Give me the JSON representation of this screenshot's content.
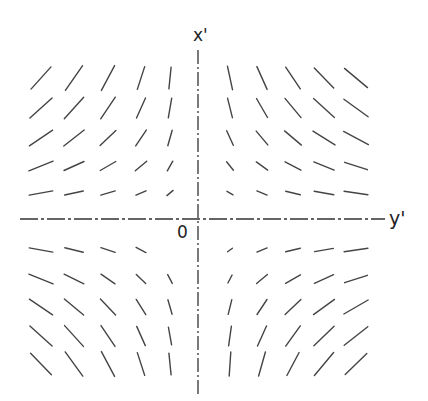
{
  "diagram": {
    "type": "direction-field",
    "axes": {
      "vertical_label": "x'",
      "horizontal_label": "y'",
      "origin_label": "0",
      "style": "dash-dot",
      "color": "#333333"
    },
    "columns_x": [
      41,
      74,
      108,
      141,
      170,
      230,
      262,
      293,
      324,
      356
    ],
    "rows_y": [
      78,
      108,
      138,
      166,
      193,
      250,
      279,
      307,
      336,
      364
    ],
    "segment_color": "#444444",
    "segments": [
      {
        "cx": 41,
        "cy": 78,
        "angle": -48,
        "len": 30
      },
      {
        "cx": 74,
        "cy": 78,
        "angle": -55,
        "len": 30
      },
      {
        "cx": 108,
        "cy": 78,
        "angle": -62,
        "len": 28
      },
      {
        "cx": 141,
        "cy": 78,
        "angle": -72,
        "len": 24
      },
      {
        "cx": 170,
        "cy": 78,
        "angle": -84,
        "len": 22
      },
      {
        "cx": 230,
        "cy": 78,
        "angle": 78,
        "len": 24
      },
      {
        "cx": 262,
        "cy": 78,
        "angle": 66,
        "len": 25
      },
      {
        "cx": 293,
        "cy": 78,
        "angle": 56,
        "len": 26
      },
      {
        "cx": 324,
        "cy": 78,
        "angle": 46,
        "len": 28
      },
      {
        "cx": 356,
        "cy": 78,
        "angle": 40,
        "len": 30
      },
      {
        "cx": 41,
        "cy": 108,
        "angle": -42,
        "len": 30
      },
      {
        "cx": 74,
        "cy": 108,
        "angle": -48,
        "len": 29
      },
      {
        "cx": 108,
        "cy": 108,
        "angle": -56,
        "len": 26
      },
      {
        "cx": 141,
        "cy": 108,
        "angle": -66,
        "len": 22
      },
      {
        "cx": 170,
        "cy": 108,
        "angle": -80,
        "len": 20
      },
      {
        "cx": 230,
        "cy": 108,
        "angle": 76,
        "len": 20
      },
      {
        "cx": 262,
        "cy": 108,
        "angle": 60,
        "len": 22
      },
      {
        "cx": 293,
        "cy": 108,
        "angle": 50,
        "len": 25
      },
      {
        "cx": 324,
        "cy": 108,
        "angle": 42,
        "len": 28
      },
      {
        "cx": 356,
        "cy": 108,
        "angle": 36,
        "len": 30
      },
      {
        "cx": 41,
        "cy": 138,
        "angle": -34,
        "len": 28
      },
      {
        "cx": 74,
        "cy": 138,
        "angle": -38,
        "len": 26
      },
      {
        "cx": 108,
        "cy": 138,
        "angle": -44,
        "len": 22
      },
      {
        "cx": 141,
        "cy": 138,
        "angle": -56,
        "len": 19
      },
      {
        "cx": 170,
        "cy": 138,
        "angle": -74,
        "len": 16
      },
      {
        "cx": 230,
        "cy": 138,
        "angle": 66,
        "len": 16
      },
      {
        "cx": 262,
        "cy": 138,
        "angle": 50,
        "len": 18
      },
      {
        "cx": 293,
        "cy": 138,
        "angle": 40,
        "len": 22
      },
      {
        "cx": 324,
        "cy": 138,
        "angle": 32,
        "len": 26
      },
      {
        "cx": 356,
        "cy": 138,
        "angle": 28,
        "len": 28
      },
      {
        "cx": 41,
        "cy": 166,
        "angle": -22,
        "len": 26
      },
      {
        "cx": 74,
        "cy": 166,
        "angle": -24,
        "len": 22
      },
      {
        "cx": 108,
        "cy": 166,
        "angle": -30,
        "len": 18
      },
      {
        "cx": 141,
        "cy": 166,
        "angle": -40,
        "len": 15
      },
      {
        "cx": 170,
        "cy": 166,
        "angle": -60,
        "len": 11
      },
      {
        "cx": 230,
        "cy": 166,
        "angle": 52,
        "len": 11
      },
      {
        "cx": 262,
        "cy": 166,
        "angle": 36,
        "len": 14
      },
      {
        "cx": 293,
        "cy": 166,
        "angle": 28,
        "len": 18
      },
      {
        "cx": 324,
        "cy": 166,
        "angle": 22,
        "len": 22
      },
      {
        "cx": 356,
        "cy": 166,
        "angle": 18,
        "len": 24
      },
      {
        "cx": 41,
        "cy": 193,
        "angle": -10,
        "len": 24
      },
      {
        "cx": 74,
        "cy": 193,
        "angle": -12,
        "len": 19
      },
      {
        "cx": 108,
        "cy": 193,
        "angle": -16,
        "len": 15
      },
      {
        "cx": 141,
        "cy": 193,
        "angle": -24,
        "len": 11
      },
      {
        "cx": 170,
        "cy": 193,
        "angle": -40,
        "len": 8
      },
      {
        "cx": 230,
        "cy": 193,
        "angle": 30,
        "len": 7
      },
      {
        "cx": 262,
        "cy": 193,
        "angle": 22,
        "len": 11
      },
      {
        "cx": 293,
        "cy": 193,
        "angle": 14,
        "len": 15
      },
      {
        "cx": 324,
        "cy": 193,
        "angle": 10,
        "len": 20
      },
      {
        "cx": 356,
        "cy": 193,
        "angle": 8,
        "len": 24
      },
      {
        "cx": 41,
        "cy": 250,
        "angle": 10,
        "len": 24
      },
      {
        "cx": 74,
        "cy": 250,
        "angle": 14,
        "len": 19
      },
      {
        "cx": 108,
        "cy": 250,
        "angle": 18,
        "len": 15
      },
      {
        "cx": 141,
        "cy": 250,
        "angle": 28,
        "len": 11
      },
      {
        "cx": 230,
        "cy": 250,
        "angle": -36,
        "len": 6
      },
      {
        "cx": 262,
        "cy": 250,
        "angle": -22,
        "len": 11
      },
      {
        "cx": 293,
        "cy": 250,
        "angle": -14,
        "len": 15
      },
      {
        "cx": 324,
        "cy": 250,
        "angle": -10,
        "len": 19
      },
      {
        "cx": 356,
        "cy": 250,
        "angle": -8,
        "len": 24
      },
      {
        "cx": 41,
        "cy": 279,
        "angle": 22,
        "len": 26
      },
      {
        "cx": 74,
        "cy": 279,
        "angle": 26,
        "len": 22
      },
      {
        "cx": 108,
        "cy": 279,
        "angle": 34,
        "len": 17
      },
      {
        "cx": 141,
        "cy": 279,
        "angle": 44,
        "len": 13
      },
      {
        "cx": 170,
        "cy": 279,
        "angle": 62,
        "len": 10
      },
      {
        "cx": 230,
        "cy": 279,
        "angle": -62,
        "len": 9
      },
      {
        "cx": 262,
        "cy": 279,
        "angle": -40,
        "len": 14
      },
      {
        "cx": 293,
        "cy": 279,
        "angle": -30,
        "len": 17
      },
      {
        "cx": 324,
        "cy": 279,
        "angle": -24,
        "len": 21
      },
      {
        "cx": 356,
        "cy": 279,
        "angle": -18,
        "len": 24
      },
      {
        "cx": 41,
        "cy": 307,
        "angle": 34,
        "len": 28
      },
      {
        "cx": 74,
        "cy": 307,
        "angle": 40,
        "len": 25
      },
      {
        "cx": 108,
        "cy": 307,
        "angle": 46,
        "len": 22
      },
      {
        "cx": 141,
        "cy": 307,
        "angle": 58,
        "len": 18
      },
      {
        "cx": 170,
        "cy": 307,
        "angle": 74,
        "len": 15
      },
      {
        "cx": 230,
        "cy": 307,
        "angle": -76,
        "len": 15
      },
      {
        "cx": 262,
        "cy": 307,
        "angle": -56,
        "len": 18
      },
      {
        "cx": 293,
        "cy": 307,
        "angle": -44,
        "len": 22
      },
      {
        "cx": 324,
        "cy": 307,
        "angle": -36,
        "len": 26
      },
      {
        "cx": 356,
        "cy": 307,
        "angle": -30,
        "len": 28
      },
      {
        "cx": 41,
        "cy": 336,
        "angle": 42,
        "len": 30
      },
      {
        "cx": 74,
        "cy": 336,
        "angle": 48,
        "len": 28
      },
      {
        "cx": 108,
        "cy": 336,
        "angle": 56,
        "len": 25
      },
      {
        "cx": 141,
        "cy": 336,
        "angle": 66,
        "len": 21
      },
      {
        "cx": 170,
        "cy": 336,
        "angle": 80,
        "len": 18
      },
      {
        "cx": 230,
        "cy": 336,
        "angle": -82,
        "len": 20
      },
      {
        "cx": 262,
        "cy": 336,
        "angle": -66,
        "len": 22
      },
      {
        "cx": 293,
        "cy": 336,
        "angle": -54,
        "len": 25
      },
      {
        "cx": 324,
        "cy": 336,
        "angle": -44,
        "len": 28
      },
      {
        "cx": 356,
        "cy": 336,
        "angle": -38,
        "len": 30
      },
      {
        "cx": 41,
        "cy": 364,
        "angle": 46,
        "len": 30
      },
      {
        "cx": 74,
        "cy": 364,
        "angle": 54,
        "len": 30
      },
      {
        "cx": 108,
        "cy": 364,
        "angle": 62,
        "len": 28
      },
      {
        "cx": 141,
        "cy": 364,
        "angle": 72,
        "len": 24
      },
      {
        "cx": 170,
        "cy": 364,
        "angle": 84,
        "len": 22
      },
      {
        "cx": 230,
        "cy": 364,
        "angle": -86,
        "len": 24
      },
      {
        "cx": 262,
        "cy": 364,
        "angle": -74,
        "len": 25
      },
      {
        "cx": 293,
        "cy": 364,
        "angle": -62,
        "len": 26
      },
      {
        "cx": 324,
        "cy": 364,
        "angle": -50,
        "len": 30
      },
      {
        "cx": 356,
        "cy": 364,
        "angle": -44,
        "len": 30
      }
    ]
  }
}
